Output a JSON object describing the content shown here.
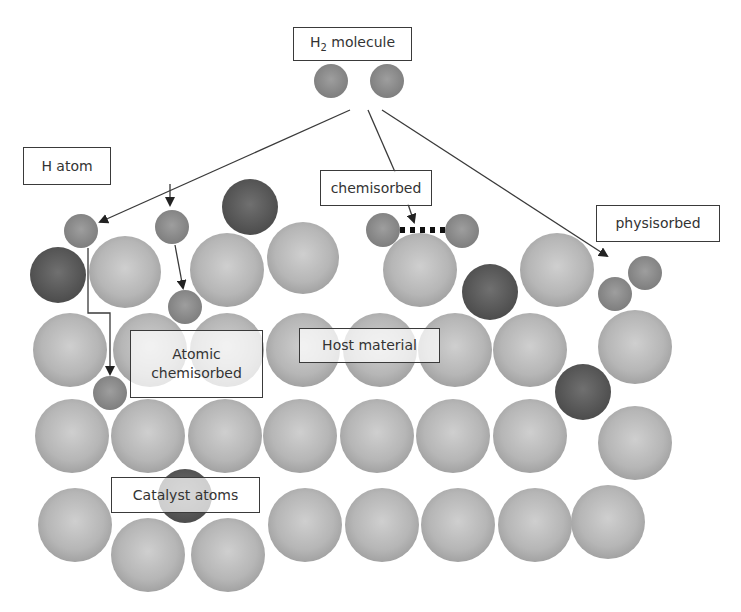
{
  "labels": {
    "h2_molecule": {
      "text": "H",
      "sub": "2",
      "rest": " molecule"
    },
    "h_atom": "H atom",
    "chemisorbed": "chemisorbed",
    "physisorbed": "physisorbed",
    "atomic_chemisorbed_1": "Atomic",
    "atomic_chemisorbed_2": "chemisorbed",
    "host_material": "Host material",
    "catalyst_atoms": "Catalyst atoms"
  },
  "colors": {
    "host": "#b4b4b4",
    "catalyst": "#5a5a5a",
    "hydrogen": "#8c8c8c",
    "arrow": "#3a3a3a",
    "bond": "#111111"
  },
  "spheres": {
    "host": [
      [
        125,
        272,
        36
      ],
      [
        227,
        270,
        37
      ],
      [
        303,
        258,
        36
      ],
      [
        420,
        270,
        37
      ],
      [
        557,
        270,
        37
      ],
      [
        70,
        350,
        37
      ],
      [
        150,
        350,
        37
      ],
      [
        227,
        350,
        37
      ],
      [
        303,
        350,
        37
      ],
      [
        380,
        350,
        37
      ],
      [
        455,
        350,
        37
      ],
      [
        530,
        350,
        37
      ],
      [
        635,
        347,
        37
      ],
      [
        72,
        436,
        37
      ],
      [
        148,
        436,
        37
      ],
      [
        225,
        436,
        37
      ],
      [
        300,
        436,
        37
      ],
      [
        377,
        436,
        37
      ],
      [
        453,
        436,
        37
      ],
      [
        530,
        436,
        37
      ],
      [
        635,
        443,
        37
      ],
      [
        75,
        525,
        37
      ],
      [
        148,
        555,
        37
      ],
      [
        228,
        555,
        37
      ],
      [
        305,
        525,
        37
      ],
      [
        382,
        525,
        37
      ],
      [
        458,
        525,
        37
      ],
      [
        535,
        525,
        37
      ],
      [
        608,
        522,
        37
      ]
    ],
    "catalyst": [
      [
        250,
        207,
        28
      ],
      [
        58,
        275,
        28
      ],
      [
        490,
        292,
        28
      ],
      [
        583,
        392,
        28
      ],
      [
        185,
        496,
        27
      ]
    ],
    "hydrogen": [
      [
        331,
        81,
        17
      ],
      [
        387,
        81,
        17
      ],
      [
        81,
        231,
        17
      ],
      [
        172,
        227,
        17
      ],
      [
        185,
        307,
        17
      ],
      [
        110,
        393,
        17
      ],
      [
        383,
        230,
        17
      ],
      [
        462,
        231,
        17
      ],
      [
        615,
        294,
        17
      ],
      [
        645,
        273,
        17
      ]
    ]
  }
}
